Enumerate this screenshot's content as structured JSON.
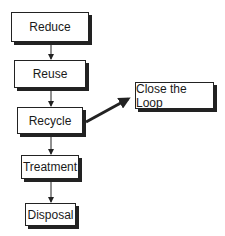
{
  "diagram": {
    "type": "flowchart",
    "nodes": [
      {
        "id": "reduce",
        "label": "Reduce"
      },
      {
        "id": "reuse",
        "label": "Reuse"
      },
      {
        "id": "recycle",
        "label": "Recycle"
      },
      {
        "id": "treatment",
        "label": "Treatment"
      },
      {
        "id": "disposal",
        "label": "Disposal"
      },
      {
        "id": "close_loop",
        "label": "Close the Loop"
      }
    ],
    "edges": [
      {
        "from": "reduce",
        "to": "reuse"
      },
      {
        "from": "reuse",
        "to": "recycle"
      },
      {
        "from": "recycle",
        "to": "treatment"
      },
      {
        "from": "treatment",
        "to": "disposal"
      },
      {
        "from": "recycle",
        "to": "close_loop",
        "style": "thick"
      }
    ]
  }
}
